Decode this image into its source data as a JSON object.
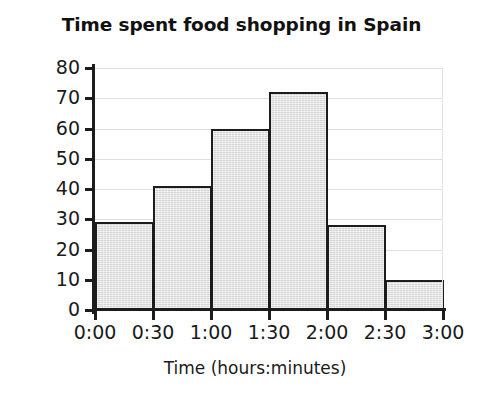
{
  "chart_data": {
    "type": "bar",
    "title": "Time spent food shopping in Spain",
    "xlabel": "Time (hours:minutes)",
    "ylabel": "Frequency",
    "categories": [
      "0:00–0:30",
      "0:30–1:00",
      "1:00–1:30",
      "1:30–2:00",
      "2:00–2:30",
      "2:30–3:00"
    ],
    "values": [
      29,
      41,
      60,
      72,
      28,
      10
    ],
    "bin_edges": [
      "0:00",
      "0:30",
      "1:00",
      "1:30",
      "2:00",
      "2:30",
      "3:00"
    ],
    "x_tick_labels": [
      "0:00",
      "0:30",
      "1:00",
      "1:30",
      "2:00",
      "2:30",
      "3:00"
    ],
    "y_tick_labels": [
      "0",
      "10",
      "20",
      "30",
      "40",
      "50",
      "60",
      "70",
      "80"
    ],
    "y_ticks": [
      0,
      10,
      20,
      30,
      40,
      50,
      60,
      70,
      80
    ],
    "ylim": [
      0,
      80
    ],
    "grid": "horizontal",
    "legend": null,
    "colors": {
      "bar_fill": "#dddddd",
      "bar_edge": "#1c1c1c",
      "gridline": "#dedede",
      "axis": "#1c1c1c",
      "text": "#1a1a1a",
      "background": "#ffffff"
    }
  }
}
